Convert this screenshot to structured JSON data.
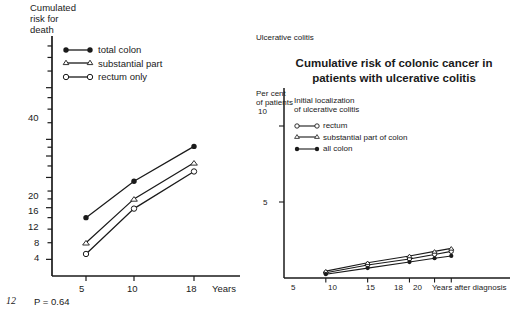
{
  "page": {
    "page_number": "12",
    "background_color": "#ffffff",
    "ink_color": "#1a1a1a"
  },
  "left_panel": {
    "y_axis_label": "Cumulated\nrisk for\ndeath",
    "y_ticks": [
      "40",
      "20",
      "16",
      "12",
      "8",
      "4"
    ],
    "x_ticks": [
      "5",
      "10",
      "18"
    ],
    "x_axis_title": "Years",
    "p_value": "P = 0.64",
    "legend": {
      "items": [
        {
          "label": "total colon",
          "marker": "filled-circle"
        },
        {
          "label": "substantial part",
          "marker": "open-triangle"
        },
        {
          "label": "rectum only",
          "marker": "open-circle"
        }
      ]
    }
  },
  "right_panel": {
    "corner_tag": "Ulcerative colitis",
    "title": "Cumulative risk of colonic cancer in patients with ulcerative colitis",
    "y_axis_label": "Per cent\nof patients",
    "y_ticks": [
      "10",
      "5"
    ],
    "x_ticks": [
      "5",
      "10",
      "15",
      "18",
      "20"
    ],
    "x_axis_title": "Years after diagnosis",
    "legend": {
      "title": "Initial localization\nof ulcerative colitis",
      "items": [
        {
          "label": "rectum",
          "marker": "open-circle"
        },
        {
          "label": "substantial part of colon",
          "marker": "open-triangle"
        },
        {
          "label": "all colon",
          "marker": "filled-circle"
        }
      ]
    }
  },
  "chart_data": [
    {
      "id": "cumulated-risk-for-death",
      "type": "line",
      "title": "",
      "xlabel": "Years",
      "ylabel": "Cumulated risk for death",
      "yscale": "log",
      "ylim": [
        3.2,
        80
      ],
      "ytick_values": [
        40,
        20,
        16,
        12,
        8,
        4
      ],
      "grid": false,
      "legend_position": "upper-left",
      "annotations": [
        "P = 0.64"
      ],
      "x": [
        5,
        10,
        18
      ],
      "series": [
        {
          "name": "total colon",
          "marker": "filled-circle",
          "values": [
            7.0,
            11.4,
            18.2
          ]
        },
        {
          "name": "substantial part",
          "marker": "open-triangle",
          "values": [
            5.0,
            9.0,
            14.6
          ]
        },
        {
          "name": "rectum only",
          "marker": "open-circle",
          "values": [
            4.3,
            7.9,
            13.0
          ]
        }
      ]
    },
    {
      "id": "cumulative-risk-colonic-cancer",
      "type": "line",
      "title": "Cumulative risk of colonic cancer in patients with ulcerative colitis",
      "xlabel": "Years after diagnosis",
      "ylabel": "Per cent of patients",
      "yscale": "linear",
      "ylim": [
        0,
        12.5
      ],
      "ytick_values": [
        5,
        10
      ],
      "xlim": [
        0,
        22
      ],
      "grid": false,
      "legend_position": "upper-left",
      "x": [
        5,
        10,
        15,
        18,
        20
      ],
      "series": [
        {
          "name": "rectum",
          "marker": "open-circle",
          "values": [
            0.35,
            0.85,
            1.25,
            1.55,
            1.75
          ]
        },
        {
          "name": "substantial part of colon",
          "marker": "open-triangle",
          "values": [
            0.45,
            1.0,
            1.45,
            1.75,
            1.95
          ]
        },
        {
          "name": "all colon",
          "marker": "filled-circle",
          "values": [
            0.25,
            0.65,
            1.05,
            1.3,
            1.45
          ]
        }
      ]
    }
  ]
}
